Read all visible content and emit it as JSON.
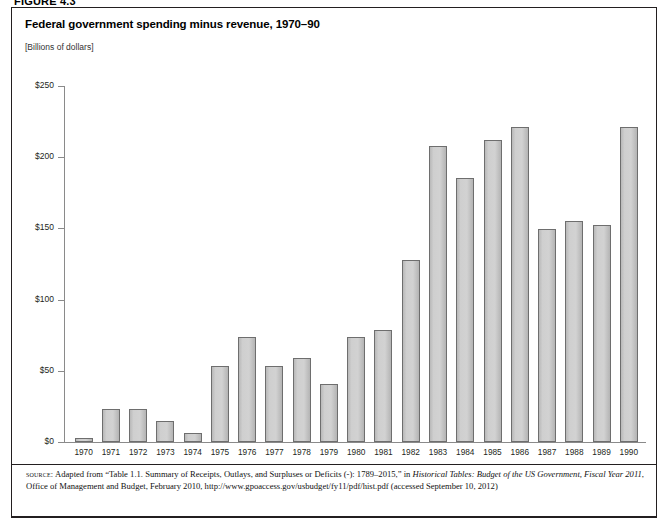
{
  "figure": {
    "number": "FIGURE 4.3"
  },
  "header": {
    "title": "Federal government spending minus revenue, 1970–90",
    "subtitle": "[Billions of dollars]"
  },
  "source": {
    "label": "source:",
    "text_1": " Adapted from “Table 1.1. Summary of Receipts, Outlays, and Surpluses or Deficits (-): 1789–2015,” in ",
    "italic_1": "Historical Tables: Budget of the US Government, Fiscal Year 2011",
    "text_2": ", Office of Management and Budget, February 2010, http://www.gpoaccess.gov/usbudget/fy11/pdf/hist.pdf (accessed September 10, 2012)"
  },
  "chart_data": {
    "type": "bar",
    "title": "Federal government spending minus revenue, 1970–90",
    "subtitle": "[Billions of dollars]",
    "xlabel": "",
    "ylabel": "[Billions of dollars]",
    "ylim": [
      0,
      250
    ],
    "yticks": [
      0,
      50,
      100,
      150,
      200,
      250
    ],
    "ytick_labels": [
      "$0",
      "$50",
      "$100",
      "$150",
      "$200",
      "$250"
    ],
    "grid": false,
    "legend": "none",
    "bar_color": "#cfcfcf",
    "bar_border_color": "#6e6e6e",
    "axis_color": "#8a8a8a",
    "categories": [
      "1970",
      "1971",
      "1972",
      "1973",
      "1974",
      "1975",
      "1976",
      "1977",
      "1978",
      "1979",
      "1980",
      "1981",
      "1982",
      "1983",
      "1984",
      "1985",
      "1986",
      "1987",
      "1988",
      "1989",
      "1990"
    ],
    "values": [
      2.8,
      23.0,
      23.4,
      14.9,
      6.1,
      53.2,
      73.7,
      53.7,
      59.2,
      40.7,
      73.8,
      79.0,
      128.0,
      207.8,
      185.4,
      212.3,
      221.2,
      149.7,
      155.2,
      152.6,
      221.0
    ]
  }
}
